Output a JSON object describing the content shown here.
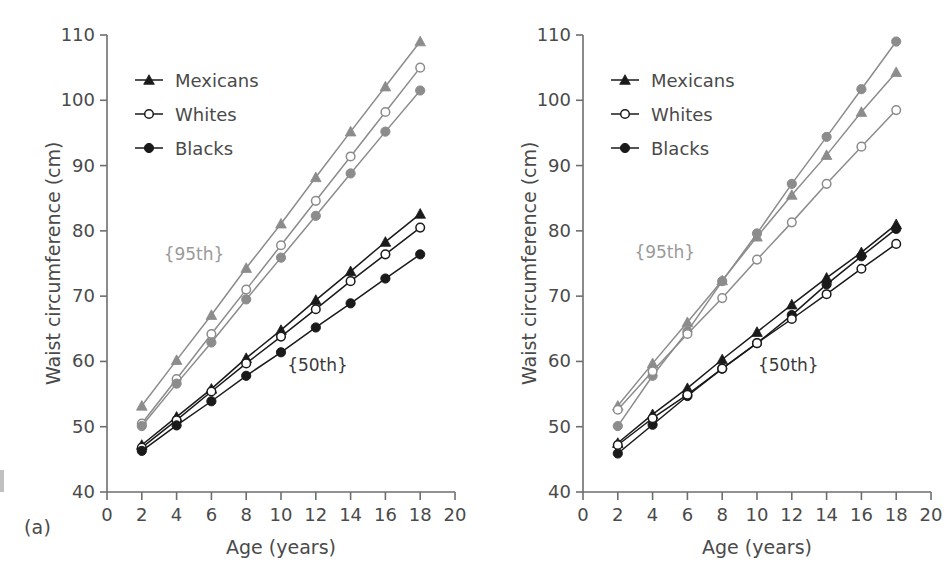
{
  "figure": {
    "panels": [
      {
        "id": "a",
        "label": "(a)",
        "axis": {
          "xlabel": "Age (years)",
          "ylabel": "Waist circumference (cm)",
          "xlim": [
            0,
            20
          ],
          "ylim": [
            40,
            110
          ],
          "xticks": [
            0,
            2,
            4,
            6,
            8,
            10,
            12,
            14,
            16,
            18,
            20
          ],
          "yticks": [
            40,
            50,
            60,
            70,
            80,
            90,
            100,
            110
          ],
          "xtick_labels": [
            "0",
            "2",
            "4",
            "6",
            "8",
            "10",
            "12",
            "14",
            "16",
            "18",
            "20"
          ],
          "ytick_labels": [
            "40",
            "50",
            "60",
            "70",
            "80",
            "90",
            "100",
            "110"
          ]
        },
        "legend": {
          "position": "upper-left",
          "entries": [
            {
              "label": "Mexicans",
              "marker": "filled-triangle"
            },
            {
              "label": "Whites",
              "marker": "open-circle"
            },
            {
              "label": "Blacks",
              "marker": "filled-circle"
            }
          ]
        },
        "annotations": [
          {
            "text": "{95th}",
            "x": 5.0,
            "y": 75.5,
            "color": "#9a9a9a"
          },
          {
            "text": "{50th}",
            "x": 12.1,
            "y": 58.5,
            "color": "#3a3a3a"
          }
        ]
      },
      {
        "id": "b",
        "label": "(b)",
        "axis": {
          "xlabel": "Age (years)",
          "ylabel": "Waist circumference (cm)",
          "xlim": [
            0,
            20
          ],
          "ylim": [
            40,
            110
          ],
          "xticks": [
            0,
            2,
            4,
            6,
            8,
            10,
            12,
            14,
            16,
            18,
            20
          ],
          "yticks": [
            40,
            50,
            60,
            70,
            80,
            90,
            100,
            110
          ],
          "xtick_labels": [
            "0",
            "2",
            "4",
            "6",
            "8",
            "10",
            "12",
            "14",
            "16",
            "18",
            "20"
          ],
          "ytick_labels": [
            "40",
            "50",
            "60",
            "70",
            "80",
            "90",
            "100",
            "110"
          ]
        },
        "legend": {
          "position": "upper-left",
          "entries": [
            {
              "label": "Mexicans",
              "marker": "filled-triangle"
            },
            {
              "label": "Whites",
              "marker": "open-circle"
            },
            {
              "label": "Blacks",
              "marker": "filled-circle"
            }
          ]
        },
        "annotations": [
          {
            "text": "{95th}",
            "x": 4.7,
            "y": 75.8,
            "color": "#9a9a9a"
          },
          {
            "text": "{50th}",
            "x": 11.8,
            "y": 58.5,
            "color": "#3a3a3a"
          }
        ]
      }
    ]
  },
  "colors": {
    "percentile_95": "#8c8c8c",
    "percentile_50": "#1a1a1a",
    "axis": "#6e6e6e",
    "text": "#4a4a4a",
    "background": "#ffffff"
  },
  "chart_data": [
    {
      "type": "line",
      "panel": "a",
      "title": "",
      "xlabel": "Age (years)",
      "ylabel": "Waist circumference (cm)",
      "xlim": [
        0,
        20
      ],
      "ylim": [
        40,
        110
      ],
      "grid": false,
      "legend_position": "upper-left",
      "x": [
        2,
        4,
        6,
        8,
        10,
        12,
        14,
        16,
        18
      ],
      "series": [
        {
          "name": "Mexicans 95th",
          "group": "95th",
          "marker": "filled-triangle",
          "color": "#8c8c8c",
          "values": [
            53.2,
            60.2,
            67.1,
            74.3,
            81.1,
            88.2,
            95.2,
            102.1,
            109.0
          ]
        },
        {
          "name": "Whites 95th",
          "group": "95th",
          "marker": "open-circle",
          "color": "#8c8c8c",
          "values": [
            50.5,
            57.3,
            64.2,
            71.0,
            77.8,
            84.6,
            91.4,
            98.2,
            105.0
          ]
        },
        {
          "name": "Blacks 95th",
          "group": "95th",
          "marker": "filled-circle",
          "color": "#8c8c8c",
          "values": [
            50.1,
            56.6,
            62.9,
            69.5,
            75.9,
            82.3,
            88.8,
            95.2,
            101.5
          ]
        },
        {
          "name": "Mexicans 50th",
          "group": "50th",
          "marker": "filled-triangle",
          "color": "#1a1a1a",
          "values": [
            47.2,
            51.5,
            55.8,
            60.5,
            64.8,
            69.4,
            73.8,
            78.3,
            82.6
          ]
        },
        {
          "name": "Whites 50th",
          "group": "50th",
          "marker": "open-circle",
          "color": "#1a1a1a",
          "values": [
            46.8,
            51.0,
            55.4,
            59.7,
            63.8,
            68.0,
            72.3,
            76.4,
            80.5
          ]
        },
        {
          "name": "Blacks 50th",
          "group": "50th",
          "marker": "filled-circle",
          "color": "#1a1a1a",
          "values": [
            46.3,
            50.2,
            53.9,
            57.8,
            61.4,
            65.2,
            68.9,
            72.7,
            76.4
          ]
        }
      ]
    },
    {
      "type": "line",
      "panel": "b",
      "title": "",
      "xlabel": "Age (years)",
      "ylabel": "Waist circumference (cm)",
      "xlim": [
        0,
        20
      ],
      "ylim": [
        40,
        110
      ],
      "grid": false,
      "legend_position": "upper-left",
      "x": [
        2,
        4,
        6,
        8,
        10,
        12,
        14,
        16,
        18
      ],
      "series": [
        {
          "name": "Blacks 95th",
          "group": "95th",
          "marker": "filled-circle",
          "color": "#8c8c8c",
          "values": [
            50.1,
            57.8,
            64.6,
            72.3,
            79.6,
            87.2,
            94.4,
            101.7,
            109.0
          ]
        },
        {
          "name": "Mexicans 95th",
          "group": "95th",
          "marker": "filled-triangle",
          "color": "#8c8c8c",
          "values": [
            53.2,
            59.7,
            66.0,
            72.4,
            79.1,
            85.5,
            91.6,
            98.2,
            104.3
          ]
        },
        {
          "name": "Whites 95th",
          "group": "95th",
          "marker": "open-circle",
          "color": "#8c8c8c",
          "values": [
            52.6,
            58.5,
            64.2,
            69.7,
            75.6,
            81.3,
            87.2,
            92.9,
            98.5
          ]
        },
        {
          "name": "Mexicans 50th",
          "group": "50th",
          "marker": "filled-triangle",
          "color": "#1a1a1a",
          "values": [
            47.5,
            51.9,
            55.9,
            60.3,
            64.5,
            68.7,
            72.8,
            76.7,
            81.0
          ]
        },
        {
          "name": "Blacks 50th",
          "group": "50th",
          "marker": "filled-circle",
          "color": "#1a1a1a",
          "values": [
            45.9,
            50.3,
            54.7,
            58.9,
            62.8,
            67.1,
            71.8,
            76.1,
            80.3
          ]
        },
        {
          "name": "Whites 50th",
          "group": "50th",
          "marker": "open-circle",
          "color": "#1a1a1a",
          "values": [
            47.2,
            51.3,
            54.9,
            58.9,
            62.8,
            66.5,
            70.3,
            74.2,
            78.0
          ]
        }
      ]
    }
  ]
}
